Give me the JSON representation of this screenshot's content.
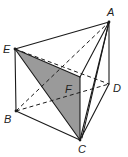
{
  "diagram": {
    "type": "geometric-solid",
    "colors": {
      "stroke": "#1a1a1a",
      "shade": "#9a9a9a",
      "background": "#ffffff"
    },
    "vertices": {
      "A": {
        "label": "A",
        "x": 109,
        "y": 22
      },
      "B": {
        "label": "B",
        "x": 16,
        "y": 111
      },
      "C": {
        "label": "C",
        "x": 80,
        "y": 140
      },
      "D": {
        "label": "D",
        "x": 109,
        "y": 84
      },
      "E": {
        "label": "E",
        "x": 15,
        "y": 49
      },
      "F": {
        "label": "F",
        "x": 80,
        "y": 77
      }
    },
    "labels": {
      "A": "A",
      "B": "B",
      "C": "C",
      "D": "D",
      "E": "E",
      "F": "F"
    },
    "solid_edges": [
      [
        "E",
        "A"
      ],
      [
        "A",
        "F"
      ],
      [
        "E",
        "F"
      ],
      [
        "E",
        "B"
      ],
      [
        "B",
        "C"
      ],
      [
        "C",
        "D"
      ],
      [
        "D",
        "A"
      ],
      [
        "F",
        "C"
      ],
      [
        "A",
        "C"
      ],
      [
        "E",
        "C"
      ]
    ],
    "dashed_edges": [
      [
        "E",
        "D"
      ],
      [
        "B",
        "D"
      ],
      [
        "B",
        "A"
      ]
    ],
    "shaded_faces": [
      [
        "E",
        "F",
        "C"
      ]
    ]
  }
}
